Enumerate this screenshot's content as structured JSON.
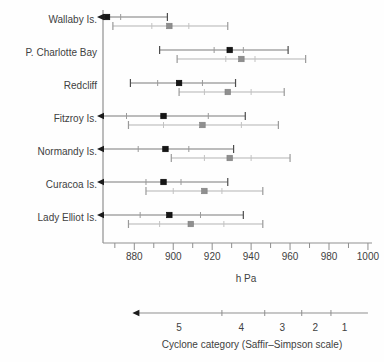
{
  "colors": {
    "axis": "#8f8f8f",
    "text": "#414141",
    "dark_series": {
      "line": "#7a7a7a",
      "cap": "#4d4d4d",
      "inner_tick": "#9a9a9a",
      "marker": "#161616",
      "arrow": "#1c1c1c"
    },
    "gray_series": {
      "line": "#b3b3b3",
      "cap": "#9a9a9a",
      "inner_tick": "#c2c2c2",
      "marker": "#8f8f8f",
      "arrow": "#1c1c1c"
    }
  },
  "chart_data": {
    "type": "interval",
    "title": "",
    "xlabel": "h Pa",
    "x_axis": {
      "min": 864,
      "max": 1002,
      "major_ticks": [
        880,
        900,
        920,
        940,
        960,
        980,
        1000
      ],
      "major_tick_labels": [
        "880",
        "900",
        "920",
        "940",
        "960",
        "980",
        "1000"
      ],
      "minor_ticks": [
        870,
        890,
        910,
        930,
        950,
        970,
        990
      ]
    },
    "sites": [
      {
        "name": "Wallaby Is.",
        "bars": [
          {
            "style": "dark",
            "center": 866,
            "inner": [
              null,
              873
            ],
            "range": [
              null,
              897
            ],
            "off_scale_left": true
          },
          {
            "style": "gray",
            "center": 898,
            "inner": [
              889,
              908
            ],
            "range": [
              869,
              928
            ],
            "off_scale_left": false
          }
        ]
      },
      {
        "name": "P. Charlotte Bay",
        "bars": [
          {
            "style": "dark",
            "center": 929,
            "inner": [
              921,
              936
            ],
            "range": [
              893,
              959
            ],
            "off_scale_left": false
          },
          {
            "style": "gray",
            "center": 935,
            "inner": [
              927,
              942
            ],
            "range": [
              902,
              968
            ],
            "off_scale_left": false
          }
        ]
      },
      {
        "name": "Redcliff",
        "bars": [
          {
            "style": "dark",
            "center": 903,
            "inner": [
              892,
              915
            ],
            "range": [
              878,
              932
            ],
            "off_scale_left": false
          },
          {
            "style": "gray",
            "center": 928,
            "inner": [
              916,
              940
            ],
            "range": [
              903,
              957
            ],
            "off_scale_left": false
          }
        ]
      },
      {
        "name": "Fitzroy Is.",
        "bars": [
          {
            "style": "dark",
            "center": 895,
            "inner": [
              876,
              918
            ],
            "range": [
              null,
              937
            ],
            "off_scale_left": true
          },
          {
            "style": "gray",
            "center": 915,
            "inner": [
              895,
              935
            ],
            "range": [
              877,
              954
            ],
            "off_scale_left": false
          }
        ]
      },
      {
        "name": "Normandy Is.",
        "bars": [
          {
            "style": "dark",
            "center": 896,
            "inner": [
              882,
              908
            ],
            "range": [
              null,
              931
            ],
            "off_scale_left": true
          },
          {
            "style": "gray",
            "center": 929,
            "inner": [
              916,
              940
            ],
            "range": [
              899,
              960
            ],
            "off_scale_left": false
          }
        ]
      },
      {
        "name": "Curacoa Is.",
        "bars": [
          {
            "style": "dark",
            "center": 895,
            "inner": [
              886,
              904
            ],
            "range": [
              null,
              928
            ],
            "off_scale_left": true
          },
          {
            "style": "gray",
            "center": 916,
            "inner": [
              900,
              925
            ],
            "range": [
              886,
              946
            ],
            "off_scale_left": false
          }
        ]
      },
      {
        "name": "Lady Elliot Is.",
        "bars": [
          {
            "style": "dark",
            "center": 898,
            "inner": [
              883,
              914
            ],
            "range": [
              null,
              936
            ],
            "off_scale_left": true
          },
          {
            "style": "gray",
            "center": 909,
            "inner": [
              893,
              926
            ],
            "range": [
              877,
              946
            ],
            "off_scale_left": false
          }
        ]
      }
    ],
    "category_axis": {
      "label": "Cyclone category (Saffir–Simpson scale)",
      "line_start_hpa": 879,
      "line_end_hpa": 1000,
      "arrow_left": true,
      "tick_values_hpa": [
        925,
        947,
        966,
        981
      ],
      "categories": [
        {
          "label": "5",
          "x_hpa": 903
        },
        {
          "label": "4",
          "x_hpa": 935
        },
        {
          "label": "3",
          "x_hpa": 956
        },
        {
          "label": "2",
          "x_hpa": 973
        },
        {
          "label": "1",
          "x_hpa": 988
        }
      ]
    }
  }
}
